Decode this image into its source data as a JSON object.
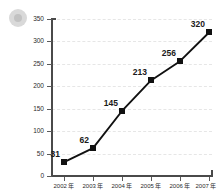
{
  "watermark": {
    "icon": "circle-badge-watermark"
  },
  "chart_data": {
    "type": "line",
    "title": "",
    "subtitle": "",
    "xlabel": "",
    "ylabel": "",
    "categories": [
      "2002 年",
      "2003 年",
      "2004 年",
      "2005 年",
      "2006 年",
      "2007 年"
    ],
    "values": [
      31,
      62,
      145,
      213,
      256,
      320
    ],
    "point_labels": [
      "31",
      "62",
      "145",
      "213",
      "256",
      "320"
    ],
    "series": [
      {
        "name": "",
        "values": [
          31,
          62,
          145,
          213,
          256,
          320
        ]
      }
    ],
    "ylim": [
      0,
      350
    ],
    "yticks": [
      0,
      50,
      100,
      150,
      200,
      250,
      300,
      350
    ],
    "ytick_labels": [
      "0",
      "50",
      "100",
      "150",
      "200",
      "250",
      "300",
      "350"
    ],
    "grid": true,
    "grid_axis": "y",
    "grid_style": "dashed",
    "legend": false,
    "marker": "square",
    "colors": {
      "line": "#111111",
      "marker": "#111111",
      "axis": "#4a4a4a",
      "grid": "#e6e6e6",
      "label_text": "#1a1a1a",
      "tick_text": "#2b2b2b",
      "background": "#ffffff"
    }
  }
}
